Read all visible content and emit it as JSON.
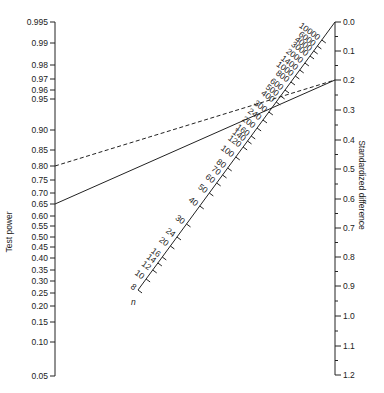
{
  "left_axis": {
    "label": "Test power",
    "ticks": [
      {
        "v": "0.995",
        "y": 22
      },
      {
        "v": "0.99",
        "y": 43
      },
      {
        "v": "0.98",
        "y": 65
      },
      {
        "v": "0.97",
        "y": 79
      },
      {
        "v": "0.96",
        "y": 90
      },
      {
        "v": "0.95",
        "y": 99
      },
      {
        "v": "0.90",
        "y": 130
      },
      {
        "v": "0.85",
        "y": 150
      },
      {
        "v": "0.80",
        "y": 166
      },
      {
        "v": "0.75",
        "y": 180
      },
      {
        "v": "0.70",
        "y": 193
      },
      {
        "v": "0.65",
        "y": 204
      },
      {
        "v": "0.60",
        "y": 216
      },
      {
        "v": "0.55",
        "y": 226
      },
      {
        "v": "0.50",
        "y": 237
      },
      {
        "v": "0.45",
        "y": 247
      },
      {
        "v": "0.40",
        "y": 258
      },
      {
        "v": "0.35",
        "y": 270
      },
      {
        "v": "0.30",
        "y": 281
      },
      {
        "v": "0.25",
        "y": 293
      },
      {
        "v": "0.20",
        "y": 306
      },
      {
        "v": "0.15",
        "y": 322
      },
      {
        "v": "0.10",
        "y": 342
      },
      {
        "v": "0.05",
        "y": 376
      }
    ]
  },
  "right_axis": {
    "label": "Standardized difference",
    "major": [
      {
        "v": "0.0",
        "y": 22
      },
      {
        "v": "0.1",
        "y": 51
      },
      {
        "v": "0.2",
        "y": 80
      },
      {
        "v": "0.3",
        "y": 110
      },
      {
        "v": "0.4",
        "y": 140
      },
      {
        "v": "0.5",
        "y": 169
      },
      {
        "v": "0.6",
        "y": 199
      },
      {
        "v": "0.7",
        "y": 228
      },
      {
        "v": "0.8",
        "y": 257
      },
      {
        "v": "0.9",
        "y": 286
      },
      {
        "v": "1.0",
        "y": 316
      },
      {
        "v": "1.1",
        "y": 346
      },
      {
        "v": "1.2",
        "y": 375
      }
    ]
  },
  "n_axis": {
    "label": "n",
    "ticks": [
      {
        "v": "10000",
        "y": 40
      },
      {
        "v": "6000",
        "y": 46
      },
      {
        "v": "4000",
        "y": 51
      },
      {
        "v": "3000",
        "y": 56
      },
      {
        "v": "2000",
        "y": 63
      },
      {
        "v": "1400",
        "y": 70
      },
      {
        "v": "1000",
        "y": 76
      },
      {
        "v": "800",
        "y": 82
      },
      {
        "v": "600",
        "y": 90
      },
      {
        "v": "500",
        "y": 96
      },
      {
        "v": "400",
        "y": 102
      },
      {
        "v": "300",
        "y": 112
      },
      {
        "v": "240",
        "y": 120
      },
      {
        "v": "200",
        "y": 128
      },
      {
        "v": "160",
        "y": 136
      },
      {
        "v": "140",
        "y": 141
      },
      {
        "v": "120",
        "y": 147
      },
      {
        "v": "100",
        "y": 157
      },
      {
        "v": "80",
        "y": 168
      },
      {
        "v": "70",
        "y": 175
      },
      {
        "v": "60",
        "y": 183
      },
      {
        "v": "50",
        "y": 193
      },
      {
        "v": "40",
        "y": 206
      },
      {
        "v": "30",
        "y": 224
      },
      {
        "v": "24",
        "y": 237
      },
      {
        "v": "20",
        "y": 246
      },
      {
        "v": "16",
        "y": 257
      },
      {
        "v": "14",
        "y": 263
      },
      {
        "v": "12",
        "y": 270
      },
      {
        "v": "10",
        "y": 279
      },
      {
        "v": "8",
        "y": 290
      }
    ]
  },
  "lines": [
    {
      "name": "solid-line",
      "from_power": "0.65",
      "to_difference": "0.2",
      "style": "solid"
    },
    {
      "name": "dashed-line",
      "from_power": "0.80",
      "to_difference": "0.2",
      "style": "dashed"
    }
  ],
  "colors": {
    "ink": "#222222",
    "background": "#ffffff"
  }
}
